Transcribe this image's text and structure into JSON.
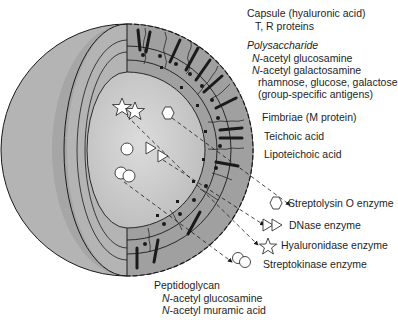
{
  "colors": {
    "outer_sphere": "#b4b4b4",
    "cut_wall_band": "#a2a2a2",
    "inner_cut_face": "#9c9c9c",
    "cytoplasm": "#c8c8c8",
    "cytoplasm_center": "#d6d6d6",
    "line": "#1a1a1a",
    "background": "#ffffff"
  },
  "labels": {
    "capsule": "Capsule (hyaluronic acid)",
    "tr_proteins": "T, R proteins",
    "polysaccharide": "Polysaccharide",
    "poly_n_glucosamine_prefix": "N",
    "poly_n_glucosamine": "-acetyl glucosamine",
    "poly_n_galactosamine_prefix": "N",
    "poly_n_galactosamine": "-acetyl galactosamine",
    "sugars": "rhamnose, glucose, galactose",
    "group_antigens": "(group-specific antigens)",
    "fimbriae": "Fimbriae (M protein)",
    "teichoic": "Teichoic acid",
    "lipoteichoic": "Lipoteichoic acid",
    "peptidoglycan": "Peptidoglycan",
    "pep_n_glucosamine_prefix": "N",
    "pep_n_glucosamine": "-acetyl glucosamine",
    "pep_n_muramic_prefix": "N",
    "pep_n_muramic": "-acetyl muramic acid"
  },
  "enzymes": [
    {
      "name": "Streptolysin O enzyme",
      "icon": "hexagon-icon"
    },
    {
      "name": "DNase enzyme",
      "icon": "triangles-icon"
    },
    {
      "name": "Hyaluronidase enzyme",
      "icon": "star-icon"
    },
    {
      "name": "Streptokinase enzyme",
      "icon": "circles-icon"
    }
  ]
}
